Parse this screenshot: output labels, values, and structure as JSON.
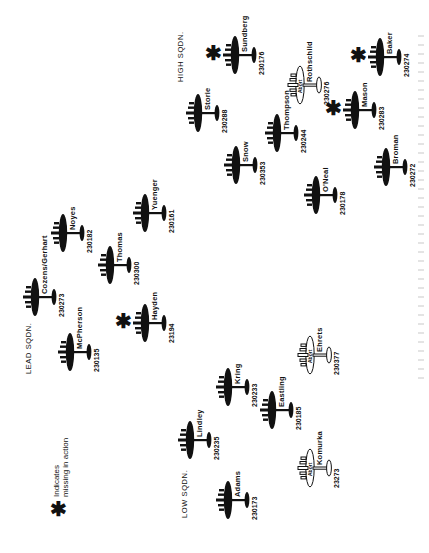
{
  "legend": {
    "symbol": "✱",
    "line1": "Indicates",
    "line2": "missing in action"
  },
  "squadrons": [
    {
      "key": "high",
      "label": "HIGH SQDN."
    },
    {
      "key": "lead",
      "label": "LEAD SQDN."
    },
    {
      "key": "low",
      "label": "LOW SQDN."
    }
  ],
  "abort_label": "Abort",
  "aircraft": [
    {
      "name": "Storie",
      "serial": "230288",
      "squadron": "high",
      "mia": false,
      "aborted": false
    },
    {
      "name": "Sundberg",
      "serial": "230176",
      "squadron": "high",
      "mia": true,
      "aborted": false
    },
    {
      "name": "Snow",
      "serial": "230353",
      "squadron": "high",
      "mia": false,
      "aborted": false
    },
    {
      "name": "Thompson",
      "serial": "230244",
      "squadron": "high",
      "mia": false,
      "aborted": false
    },
    {
      "name": "O'Neal",
      "serial": "230178",
      "squadron": "high",
      "mia": false,
      "aborted": false
    },
    {
      "name": "Rothschild",
      "serial": "230276",
      "squadron": "high",
      "mia": false,
      "aborted": true
    },
    {
      "name": "Mason",
      "serial": "230283",
      "squadron": "high",
      "mia": true,
      "aborted": false
    },
    {
      "name": "Baker",
      "serial": "230274",
      "squadron": "high",
      "mia": true,
      "aborted": false
    },
    {
      "name": "Broman",
      "serial": "230272",
      "squadron": "high",
      "mia": false,
      "aborted": false
    },
    {
      "name": "Cozens/Gerhart",
      "serial": "230273",
      "squadron": "lead",
      "mia": false,
      "aborted": false
    },
    {
      "name": "Noyes",
      "serial": "230182",
      "squadron": "lead",
      "mia": false,
      "aborted": false
    },
    {
      "name": "Thomas",
      "serial": "230300",
      "squadron": "lead",
      "mia": false,
      "aborted": false
    },
    {
      "name": "Yuenger",
      "serial": "230161",
      "squadron": "lead",
      "mia": false,
      "aborted": false
    },
    {
      "name": "McPherson",
      "serial": "230135",
      "squadron": "lead",
      "mia": false,
      "aborted": false
    },
    {
      "name": "Hayden",
      "serial": "23194",
      "squadron": "lead",
      "mia": true,
      "aborted": false
    },
    {
      "name": "Lindley",
      "serial": "230235",
      "squadron": "low",
      "mia": false,
      "aborted": false
    },
    {
      "name": "Kring",
      "serial": "230233",
      "squadron": "low",
      "mia": false,
      "aborted": false
    },
    {
      "name": "Eastling",
      "serial": "230185",
      "squadron": "low",
      "mia": false,
      "aborted": false
    },
    {
      "name": "Ehrets",
      "serial": "230377",
      "squadron": "low",
      "mia": false,
      "aborted": true
    },
    {
      "name": "Adams",
      "serial": "230173",
      "squadron": "low",
      "mia": false,
      "aborted": false
    },
    {
      "name": "Komurka",
      "serial": "23273",
      "squadron": "low",
      "mia": false,
      "aborted": true
    }
  ],
  "colors": {
    "ink": "#111111",
    "background": "#ffffff"
  }
}
